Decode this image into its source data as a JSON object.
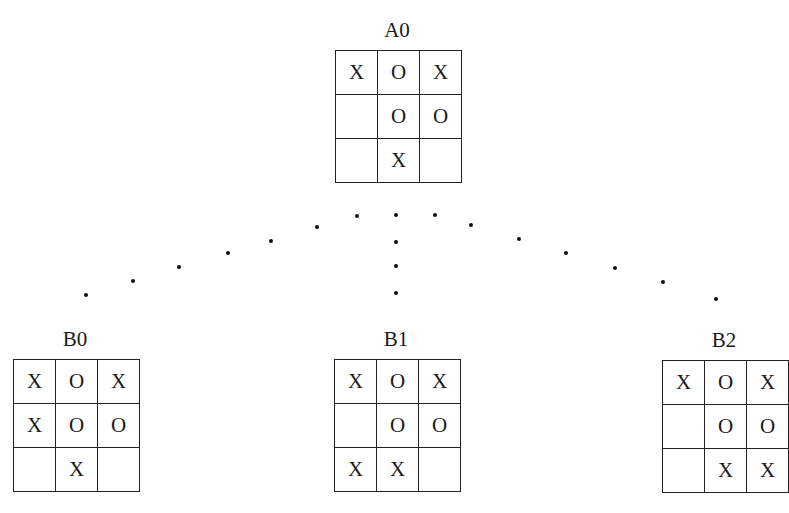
{
  "diagram": {
    "root": {
      "label": "A0",
      "board": [
        [
          "X",
          "O",
          "X"
        ],
        [
          "",
          "O",
          "O"
        ],
        [
          "",
          "X",
          ""
        ]
      ]
    },
    "children": [
      {
        "label": "B0",
        "board": [
          [
            "X",
            "O",
            "X"
          ],
          [
            "X",
            "O",
            "O"
          ],
          [
            "",
            "X",
            ""
          ]
        ]
      },
      {
        "label": "B1",
        "board": [
          [
            "X",
            "O",
            "X"
          ],
          [
            "",
            "O",
            "O"
          ],
          [
            "X",
            "X",
            ""
          ]
        ]
      },
      {
        "label": "B2",
        "board": [
          [
            "X",
            "O",
            "X"
          ],
          [
            "",
            "O",
            "O"
          ],
          [
            "",
            "X",
            "X"
          ]
        ]
      }
    ],
    "edges": [
      {
        "from": "A0",
        "to": "B0",
        "style": "dotted"
      },
      {
        "from": "A0",
        "to": "B1",
        "style": "dotted"
      },
      {
        "from": "A0",
        "to": "B2",
        "style": "dotted"
      }
    ]
  }
}
